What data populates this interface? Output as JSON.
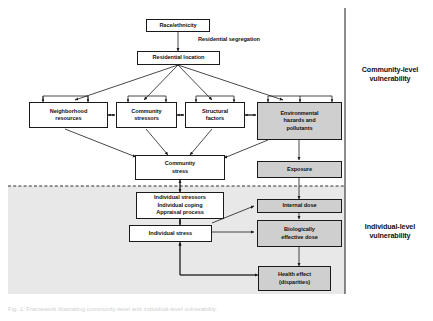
{
  "figure": {
    "background_color": "#ffffff",
    "shaded_region_color": "#e8e8e8",
    "box_fill_white": "#ffffff",
    "box_fill_gray": "#cfcfcf",
    "line_color": "#1a1a1a"
  },
  "nodes": {
    "race_ethnicity": "Race/ethnicity",
    "residential_location": "Residential location",
    "neighborhood_resources": "Neighborhood resources",
    "community_stressors": "Community stressors",
    "structural_factors": "Structural factors",
    "environmental_hazards": "Environmental hazards and pollutants",
    "community_stress": "Community stress",
    "exposure": "Exposure",
    "individual_stressors": "Individual stressors Individual coping Appraisal process",
    "individual_stress": "Individual stress",
    "internal_dose": "Internal dose",
    "biologically_effective_dose": "Biologically effective dose",
    "health_effect": "Health effect (disparities)"
  },
  "node_lines": {
    "neighborhood_resources": [
      "Neighborhood",
      "resources"
    ],
    "community_stressors": [
      "Community",
      "stressors"
    ],
    "structural_factors": [
      "Structural",
      "factors"
    ],
    "environmental_hazards": [
      "Environmental",
      "hazards and",
      "pollutants"
    ],
    "community_stress": [
      "Community",
      "stress"
    ],
    "individual_stressors": [
      "Individual stressors",
      "Individual coping",
      "Appraisal process"
    ],
    "biologically_effective_dose": [
      "Biologically",
      "effective dose"
    ],
    "health_effect": [
      "Health effect",
      "(disparities)"
    ]
  },
  "annotations": {
    "residential_segregation": "Residential segregation"
  },
  "side_labels": {
    "community_level": [
      "Community-level",
      "vulnerability"
    ],
    "individual_level": [
      "Individual-level",
      "vulnerability"
    ]
  },
  "caption": "Fig. 1. Framework illustrating community-level and individual-level vulnerability."
}
